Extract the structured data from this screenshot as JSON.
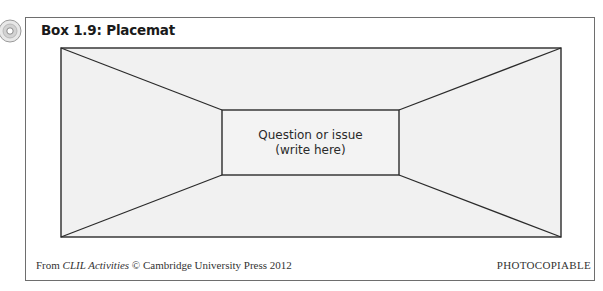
{
  "box": {
    "title": "Box 1.9: Placemat",
    "icon": "cd-disc-icon"
  },
  "placemat": {
    "center_text_line1": "Question or issue",
    "center_text_line2": "(write here)",
    "sections": 4,
    "fill_color": "#f1f1f1",
    "line_color": "#2b2b2b"
  },
  "footer": {
    "source_prefix": "From ",
    "source_title": "CLIL Activities",
    "source_suffix": " © Cambridge University Press 2012",
    "rights": "PHOTOCOPIABLE"
  }
}
